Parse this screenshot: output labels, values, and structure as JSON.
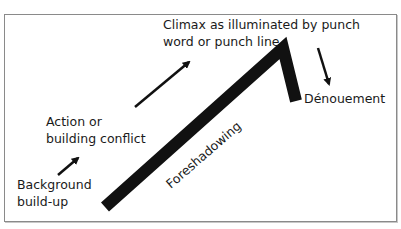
{
  "diagram": {
    "type": "plot structure (joke / story arc)",
    "labels": {
      "climax_line1": "Climax as illuminated by punch",
      "climax_line2": "word or punch line",
      "denouement": "Dénouement",
      "action_line1": "Action or",
      "action_line2": "building conflict",
      "background_line1": "Background",
      "background_line2": "build-up",
      "foreshadowing": "Foreshadowing"
    },
    "colors": {
      "line": "#111111",
      "border": "#8a8a8a",
      "text": "#1a1a1a"
    }
  }
}
